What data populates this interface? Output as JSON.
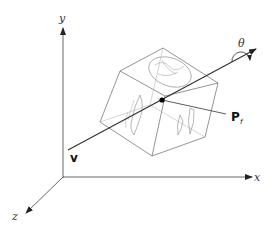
{
  "figure": {
    "axes": {
      "x_label": "x",
      "y_label": "y",
      "z_label": "z"
    },
    "rotation_axis_label": "v",
    "rotation_angle_label": "θ",
    "fixed_point_label": "P",
    "fixed_point_subscript": "f",
    "object": "cube-with-textured-faces",
    "colors": {
      "line": "#555555",
      "axis": "#444444",
      "point": "#000000",
      "texture": "#888888"
    }
  }
}
